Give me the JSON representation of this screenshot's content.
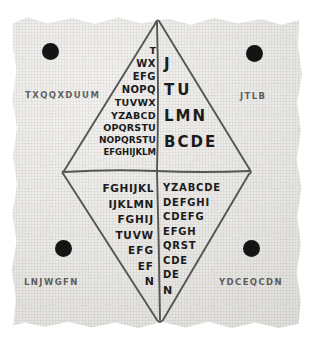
{
  "artifact": {
    "title": "Hand-drawn cipher diamond on torn paper",
    "paper_color": "#e9e8e5",
    "ink_color": "#1b1b1b",
    "dot_color": "#141414"
  },
  "corner_labels": [
    {
      "id": "top-left",
      "text": "TXQQXDUUM"
    },
    {
      "id": "top-right",
      "text": "JTLB"
    },
    {
      "id": "bottom-left",
      "text": "LNJWGFN"
    },
    {
      "id": "bottom-right",
      "text": "YDCEQCDN"
    }
  ],
  "corner_dots": [
    {
      "id": "dot-top-left"
    },
    {
      "id": "dot-top-right"
    },
    {
      "id": "dot-bottom-left"
    },
    {
      "id": "dot-bottom-right"
    }
  ],
  "quadrants": {
    "upper_left": {
      "name": "upper-left-triangle",
      "rows": [
        "T",
        "WX",
        "EFG",
        "NOPQ",
        "TUVWX",
        "YZABCD",
        "OPQRSTU",
        "NOPQRSTU",
        "EFGHIJKLM"
      ]
    },
    "upper_right": {
      "name": "upper-right-triangle",
      "rows": [
        "J",
        "TU",
        "LMN",
        "BCDE"
      ]
    },
    "lower_left": {
      "name": "lower-left-triangle",
      "rows": [
        "FGHIJKL",
        "IJKLMN",
        "FGHIJ",
        "TUVW",
        "EFG",
        "EF",
        "N"
      ]
    },
    "lower_right": {
      "name": "lower-right-triangle",
      "rows": [
        "YZABCDE",
        "DEFGHI",
        "CDEFG",
        "EFGH",
        "QRST",
        "CDE",
        "DE",
        "N"
      ]
    }
  }
}
